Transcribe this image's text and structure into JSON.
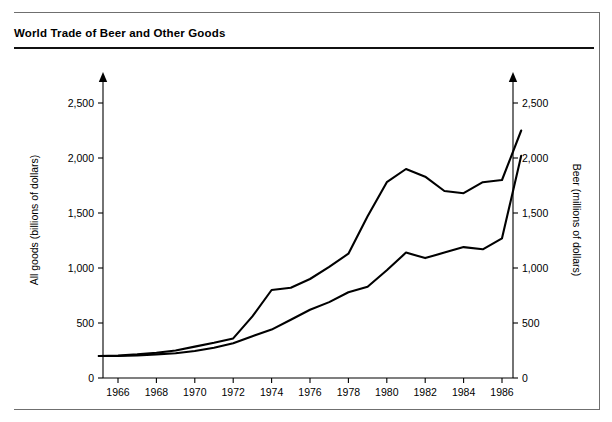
{
  "figure": {
    "title": "World Trade of Beer and Other Goods"
  },
  "chart_data": {
    "type": "line",
    "title": "World Trade of Beer and Other Goods",
    "xlabel": "",
    "ylabel": "All goods (billions of dollars)",
    "y2label": "Beer (millions of dollars)",
    "xlim": [
      1965,
      1987
    ],
    "ylim": [
      0,
      2750
    ],
    "y2lim": [
      0,
      2750
    ],
    "grid": false,
    "legend": "none",
    "xticks": [
      1966,
      1968,
      1970,
      1972,
      1974,
      1976,
      1978,
      1980,
      1982,
      1984,
      1986
    ],
    "xtick_labels": [
      "1966",
      "1968",
      "1970",
      "1972",
      "1974",
      "1976",
      "1978",
      "1980",
      "1982",
      "1984",
      "1986"
    ],
    "yticks": [
      0,
      500,
      1000,
      1500,
      2000,
      2500
    ],
    "ytick_labels": [
      "0",
      "500",
      "1,000",
      "1,500",
      "2,000",
      "2,500"
    ],
    "y2ticks": [
      0,
      500,
      1000,
      1500,
      2000,
      2500
    ],
    "y2tick_labels": [
      "0",
      "500",
      "1,000",
      "1,500",
      "2,000",
      "2,500"
    ],
    "x": [
      1965,
      1966,
      1967,
      1968,
      1969,
      1970,
      1971,
      1972,
      1973,
      1974,
      1975,
      1976,
      1977,
      1978,
      1979,
      1980,
      1981,
      1982,
      1983,
      1984,
      1985,
      1986,
      1987
    ],
    "series": [
      {
        "name": "All goods (billions of dollars)",
        "axis": "left",
        "values": [
          200,
          205,
          215,
          230,
          250,
          285,
          320,
          360,
          560,
          800,
          820,
          900,
          1010,
          1130,
          1470,
          1780,
          1900,
          1830,
          1700,
          1680,
          1780,
          1800,
          2250
        ]
      },
      {
        "name": "Beer (millions of dollars)",
        "axis": "right",
        "values": [
          200,
          200,
          205,
          215,
          225,
          245,
          275,
          315,
          380,
          440,
          530,
          620,
          690,
          780,
          830,
          980,
          1140,
          1090,
          1140,
          1190,
          1170,
          1270,
          2020
        ]
      }
    ]
  },
  "axes": {
    "left_title": "All goods (billions of dollars)",
    "right_title": "Beer (millions of dollars)"
  }
}
